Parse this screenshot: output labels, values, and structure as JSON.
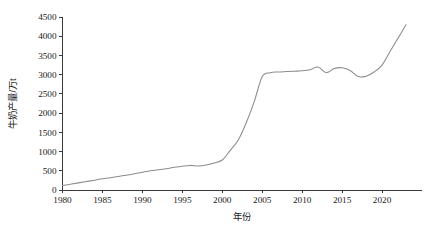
{
  "chart_data": {
    "type": "line",
    "title": "",
    "xlabel": "年份",
    "ylabel": "牛奶产量/万t",
    "xlim": [
      1980,
      2025
    ],
    "ylim": [
      0,
      4500
    ],
    "grid": false,
    "legend": null,
    "line_color": "#8c8c8c",
    "axis_color": "#3a3a3a",
    "xticks": [
      1980,
      1985,
      1990,
      1995,
      2000,
      2005,
      2010,
      2015,
      2020
    ],
    "xtick_labels": [
      "1980",
      "1985",
      "1990",
      "1995",
      "2000",
      "2005",
      "2010",
      "2015",
      "2020"
    ],
    "yticks": [
      0,
      500,
      1000,
      1500,
      2000,
      2500,
      3000,
      3500,
      4000,
      4500
    ],
    "ytick_labels": [
      "0",
      "500",
      "1000",
      "1500",
      "2000",
      "2500",
      "3000",
      "3500",
      "4000",
      "4500"
    ],
    "series": [
      {
        "name": "牛奶产量",
        "x": [
          1980,
          1981,
          1982,
          1983,
          1984,
          1985,
          1986,
          1987,
          1988,
          1989,
          1990,
          1991,
          1992,
          1993,
          1994,
          1995,
          1996,
          1997,
          1998,
          1999,
          2000,
          2001,
          2002,
          2003,
          2004,
          2005,
          2006,
          2007,
          2008,
          2009,
          2010,
          2011,
          2012,
          2013,
          2014,
          2015,
          2016,
          2017,
          2018,
          2019,
          2020,
          2021,
          2022,
          2023
        ],
        "values": [
          115,
          150,
          185,
          220,
          255,
          290,
          320,
          350,
          385,
          420,
          460,
          500,
          525,
          555,
          590,
          620,
          640,
          625,
          650,
          700,
          780,
          1030,
          1300,
          1750,
          2300,
          2950,
          3050,
          3070,
          3080,
          3090,
          3100,
          3130,
          3200,
          3050,
          3160,
          3180,
          3110,
          2950,
          2960,
          3070,
          3250,
          3600,
          3950,
          4300
        ]
      }
    ]
  }
}
